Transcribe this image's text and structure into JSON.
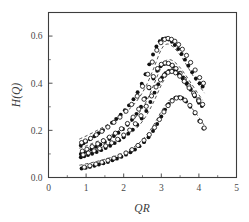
{
  "chart_data": {
    "type": "scatter",
    "title": "",
    "xlabel": "QR",
    "ylabel": "H(Q)",
    "xlim": [
      0,
      5
    ],
    "ylim": [
      0.0,
      0.7
    ],
    "xticks": [
      0,
      1,
      2,
      3,
      4,
      5
    ],
    "xtick_labels": [
      "0",
      "1",
      "2",
      "3",
      "4",
      "5"
    ],
    "yticks": [
      0.0,
      0.2,
      0.4,
      0.6
    ],
    "ytick_labels": [
      "0.0",
      "0.2",
      "0.4",
      "0.6"
    ],
    "xminor_ticks": [
      0.5,
      1.5,
      2.5,
      3.5,
      4.5
    ],
    "yminor_ticks": [
      0.1,
      0.3,
      0.5,
      0.7
    ],
    "grid": false,
    "legend": "none",
    "marker_styles": [
      "filled-circle",
      "open-circle"
    ],
    "line_style": "dashed",
    "colors": {
      "marker_filled": "#111111",
      "marker_open_edge": "#111111",
      "marker_open_fill": "#ffffff",
      "curve": "#2b2b2b",
      "axis": "#3d3d3d",
      "text": "#3a3a3a",
      "background": "#ffffff"
    },
    "series": [
      {
        "name": "series-1-top",
        "marker": "filled-circle",
        "x": [
          0.86,
          0.93,
          1.0,
          1.1,
          1.22,
          1.33,
          1.45,
          1.57,
          1.69,
          1.8,
          1.92,
          2.03,
          2.14,
          2.26,
          2.37,
          2.48,
          2.58,
          2.68,
          2.78,
          2.87,
          2.96,
          3.04,
          3.12,
          3.2,
          3.28,
          3.36,
          3.45,
          3.54,
          3.63,
          3.72,
          3.82,
          3.92,
          4.02,
          4.1
        ],
        "y": [
          0.136,
          0.145,
          0.152,
          0.162,
          0.175,
          0.188,
          0.201,
          0.216,
          0.232,
          0.248,
          0.266,
          0.285,
          0.306,
          0.332,
          0.362,
          0.398,
          0.438,
          0.48,
          0.522,
          0.556,
          0.578,
          0.588,
          0.59,
          0.585,
          0.576,
          0.562,
          0.545,
          0.524,
          0.5,
          0.474,
          0.447,
          0.42,
          0.4,
          0.386
        ]
      },
      {
        "name": "series-1-top-open",
        "marker": "open-circle",
        "x": [
          0.88,
          0.98,
          1.12,
          1.27,
          1.42,
          1.58,
          1.74,
          1.9,
          2.06,
          2.21,
          2.36,
          2.5,
          2.64,
          2.76,
          2.88,
          2.99,
          3.09,
          3.18,
          3.27,
          3.36,
          3.46,
          3.56,
          3.67,
          3.78,
          3.9,
          4.02,
          4.12
        ],
        "y": [
          0.148,
          0.155,
          0.166,
          0.181,
          0.196,
          0.214,
          0.234,
          0.256,
          0.281,
          0.31,
          0.345,
          0.387,
          0.438,
          0.49,
          0.54,
          0.572,
          0.586,
          0.59,
          0.586,
          0.578,
          0.564,
          0.544,
          0.518,
          0.488,
          0.456,
          0.424,
          0.4
        ]
      },
      {
        "name": "series-2",
        "marker": "filled-circle",
        "x": [
          0.86,
          0.94,
          1.03,
          1.14,
          1.26,
          1.38,
          1.5,
          1.62,
          1.74,
          1.86,
          1.98,
          2.1,
          2.22,
          2.34,
          2.46,
          2.57,
          2.68,
          2.79,
          2.89,
          2.98,
          3.07,
          3.15,
          3.23,
          3.31,
          3.4,
          3.49,
          3.58,
          3.68,
          3.78,
          3.88,
          3.98,
          4.08
        ],
        "y": [
          0.1,
          0.106,
          0.112,
          0.12,
          0.13,
          0.14,
          0.151,
          0.163,
          0.176,
          0.19,
          0.206,
          0.224,
          0.245,
          0.27,
          0.3,
          0.336,
          0.378,
          0.42,
          0.453,
          0.472,
          0.481,
          0.483,
          0.48,
          0.472,
          0.46,
          0.444,
          0.424,
          0.401,
          0.376,
          0.35,
          0.325,
          0.303
        ]
      },
      {
        "name": "series-2-open",
        "marker": "open-circle",
        "x": [
          0.9,
          1.02,
          1.16,
          1.31,
          1.46,
          1.62,
          1.78,
          1.94,
          2.1,
          2.25,
          2.4,
          2.54,
          2.67,
          2.79,
          2.9,
          3.0,
          3.1,
          3.19,
          3.29,
          3.39,
          3.5,
          3.61,
          3.73,
          3.86,
          3.99,
          4.1
        ],
        "y": [
          0.112,
          0.12,
          0.131,
          0.143,
          0.156,
          0.171,
          0.188,
          0.207,
          0.229,
          0.256,
          0.29,
          0.332,
          0.382,
          0.428,
          0.462,
          0.48,
          0.486,
          0.484,
          0.476,
          0.462,
          0.442,
          0.417,
          0.389,
          0.358,
          0.33,
          0.31
        ]
      },
      {
        "name": "series-3",
        "marker": "filled-circle",
        "x": [
          0.86,
          0.95,
          1.05,
          1.16,
          1.28,
          1.4,
          1.52,
          1.64,
          1.76,
          1.88,
          2.0,
          2.12,
          2.24,
          2.36,
          2.48,
          2.6,
          2.71,
          2.82,
          2.92,
          3.02,
          3.11,
          3.2,
          3.29,
          3.38,
          3.47,
          3.57,
          3.67,
          3.78,
          3.89,
          4.0
        ],
        "y": [
          0.086,
          0.09,
          0.095,
          0.101,
          0.108,
          0.116,
          0.125,
          0.135,
          0.146,
          0.158,
          0.171,
          0.186,
          0.203,
          0.224,
          0.25,
          0.282,
          0.32,
          0.36,
          0.396,
          0.424,
          0.442,
          0.452,
          0.455,
          0.45,
          0.438,
          0.42,
          0.398,
          0.372,
          0.344,
          0.317
        ]
      },
      {
        "name": "series-3-open",
        "marker": "open-circle",
        "x": [
          0.92,
          1.06,
          1.21,
          1.36,
          1.52,
          1.68,
          1.84,
          2.0,
          2.16,
          2.31,
          2.46,
          2.6,
          2.74,
          2.86,
          2.98,
          3.08,
          3.18,
          3.28,
          3.38,
          3.49,
          3.61,
          3.74,
          3.88,
          4.0
        ],
        "y": [
          0.096,
          0.104,
          0.113,
          0.123,
          0.134,
          0.147,
          0.162,
          0.18,
          0.201,
          0.228,
          0.262,
          0.302,
          0.346,
          0.384,
          0.414,
          0.434,
          0.446,
          0.45,
          0.444,
          0.43,
          0.408,
          0.38,
          0.35,
          0.325
        ]
      },
      {
        "name": "series-4-bottom",
        "marker": "filled-circle",
        "x": [
          0.88,
          0.99,
          1.1,
          1.22,
          1.34,
          1.46,
          1.58,
          1.7,
          1.82,
          1.94,
          2.06,
          2.18,
          2.3,
          2.42,
          2.54,
          2.66,
          2.78,
          2.89,
          3.0,
          3.1,
          3.2,
          3.29,
          3.38,
          3.47,
          3.56,
          3.66,
          3.77,
          3.89,
          4.01,
          4.12
        ],
        "y": [
          0.038,
          0.041,
          0.045,
          0.05,
          0.055,
          0.06,
          0.066,
          0.073,
          0.08,
          0.088,
          0.097,
          0.107,
          0.119,
          0.133,
          0.15,
          0.171,
          0.197,
          0.227,
          0.259,
          0.288,
          0.312,
          0.329,
          0.339,
          0.341,
          0.336,
          0.322,
          0.3,
          0.272,
          0.24,
          0.208
        ]
      },
      {
        "name": "series-4-bottom-open",
        "marker": "open-circle",
        "x": [
          0.95,
          1.1,
          1.26,
          1.42,
          1.58,
          1.74,
          1.9,
          2.06,
          2.22,
          2.38,
          2.54,
          2.68,
          2.82,
          2.95,
          3.07,
          3.18,
          3.29,
          3.4,
          3.51,
          3.63,
          3.76,
          3.9,
          4.04,
          4.14
        ],
        "y": [
          0.044,
          0.05,
          0.057,
          0.065,
          0.073,
          0.082,
          0.092,
          0.104,
          0.118,
          0.136,
          0.158,
          0.182,
          0.212,
          0.246,
          0.278,
          0.305,
          0.325,
          0.337,
          0.338,
          0.328,
          0.306,
          0.275,
          0.238,
          0.21
        ]
      }
    ],
    "theory_curves": [
      {
        "name": "theory-curve-1",
        "x": [
          0.82,
          1.0,
          1.2,
          1.4,
          1.6,
          1.8,
          2.0,
          2.2,
          2.4,
          2.6,
          2.8,
          2.95,
          3.05,
          3.15,
          3.25,
          3.4,
          3.55,
          3.7,
          3.85,
          4.0,
          4.15
        ],
        "y": [
          0.163,
          0.176,
          0.192,
          0.209,
          0.227,
          0.247,
          0.27,
          0.298,
          0.336,
          0.39,
          0.464,
          0.526,
          0.556,
          0.566,
          0.562,
          0.54,
          0.508,
          0.47,
          0.43,
          0.392,
          0.358
        ]
      },
      {
        "name": "theory-curve-2",
        "x": [
          0.82,
          1.0,
          1.2,
          1.4,
          1.6,
          1.8,
          2.0,
          2.2,
          2.4,
          2.6,
          2.8,
          2.98,
          3.1,
          3.2,
          3.32,
          3.48,
          3.64,
          3.8,
          3.96,
          4.1
        ],
        "y": [
          0.124,
          0.134,
          0.147,
          0.16,
          0.175,
          0.192,
          0.212,
          0.237,
          0.272,
          0.322,
          0.394,
          0.462,
          0.492,
          0.5,
          0.494,
          0.47,
          0.436,
          0.398,
          0.36,
          0.328
        ]
      },
      {
        "name": "theory-curve-3",
        "x": [
          0.82,
          1.0,
          1.2,
          1.4,
          1.6,
          1.8,
          2.0,
          2.2,
          2.4,
          2.6,
          2.8,
          3.0,
          3.14,
          3.25,
          3.38,
          3.54,
          3.7,
          3.86,
          4.0,
          4.12
        ],
        "y": [
          0.098,
          0.106,
          0.116,
          0.127,
          0.139,
          0.153,
          0.169,
          0.19,
          0.219,
          0.262,
          0.322,
          0.392,
          0.43,
          0.443,
          0.44,
          0.42,
          0.39,
          0.356,
          0.325,
          0.3
        ]
      },
      {
        "name": "theory-curve-4",
        "x": [
          0.82,
          1.0,
          1.2,
          1.4,
          1.6,
          1.8,
          2.0,
          2.2,
          2.4,
          2.6,
          2.8,
          3.0,
          3.18,
          3.32,
          3.46,
          3.62,
          3.78,
          3.94,
          4.08,
          4.2
        ],
        "y": [
          0.052,
          0.058,
          0.065,
          0.073,
          0.082,
          0.092,
          0.105,
          0.122,
          0.145,
          0.178,
          0.224,
          0.28,
          0.322,
          0.34,
          0.34,
          0.326,
          0.3,
          0.268,
          0.236,
          0.208
        ]
      }
    ]
  },
  "figure": {
    "xlabel": "QR",
    "ylabel": "H(Q)"
  }
}
